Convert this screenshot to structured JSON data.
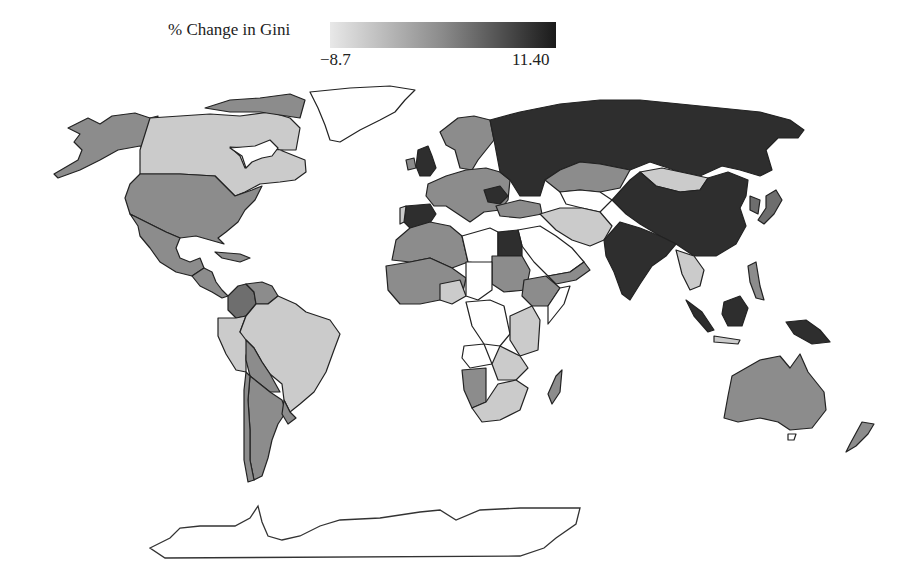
{
  "figure": {
    "type": "choropleth world map",
    "legend": {
      "title": "% Change in Gini",
      "min_label": "−8.7",
      "max_label": "11.40",
      "min_value": -8.7,
      "max_value": 11.4,
      "gradient_from": "#e6e6e6",
      "gradient_to": "#1c1c1c"
    },
    "shades": {
      "no_data": "#ffffff",
      "light": "#cbcbcb",
      "mid": "#8c8c8c",
      "dark_mid": "#6e6e6e",
      "dark": "#2e2e2e"
    },
    "regions": [
      {
        "name": "Alaska (USA)",
        "shade": "mid"
      },
      {
        "name": "Canada",
        "shade": "light"
      },
      {
        "name": "Greenland",
        "shade": "no_data"
      },
      {
        "name": "United States",
        "shade": "mid"
      },
      {
        "name": "Mexico",
        "shade": "mid"
      },
      {
        "name": "Central America",
        "shade": "mid"
      },
      {
        "name": "Colombia",
        "shade": "dark_mid"
      },
      {
        "name": "Venezuela",
        "shade": "mid"
      },
      {
        "name": "Brazil",
        "shade": "light"
      },
      {
        "name": "Peru",
        "shade": "light"
      },
      {
        "name": "Bolivia",
        "shade": "mid"
      },
      {
        "name": "Argentina",
        "shade": "mid"
      },
      {
        "name": "Chile",
        "shade": "mid"
      },
      {
        "name": "United Kingdom",
        "shade": "dark"
      },
      {
        "name": "Spain",
        "shade": "dark"
      },
      {
        "name": "Scandinavia",
        "shade": "mid"
      },
      {
        "name": "Western Europe",
        "shade": "mid"
      },
      {
        "name": "Russia",
        "shade": "dark"
      },
      {
        "name": "Kazakhstan",
        "shade": "mid"
      },
      {
        "name": "Mongolia",
        "shade": "light"
      },
      {
        "name": "China",
        "shade": "dark"
      },
      {
        "name": "India",
        "shade": "dark"
      },
      {
        "name": "Iran",
        "shade": "light"
      },
      {
        "name": "Saudi Arabia",
        "shade": "no_data"
      },
      {
        "name": "Egypt",
        "shade": "dark"
      },
      {
        "name": "Algeria",
        "shade": "mid"
      },
      {
        "name": "Libya",
        "shade": "no_data"
      },
      {
        "name": "Sudan",
        "shade": "mid"
      },
      {
        "name": "DR Congo",
        "shade": "no_data"
      },
      {
        "name": "Ethiopia",
        "shade": "mid"
      },
      {
        "name": "South Africa",
        "shade": "light"
      },
      {
        "name": "Namibia",
        "shade": "mid"
      },
      {
        "name": "Madagascar",
        "shade": "mid"
      },
      {
        "name": "Indonesia (Borneo)",
        "shade": "dark"
      },
      {
        "name": "Papua New Guinea",
        "shade": "dark"
      },
      {
        "name": "Japan",
        "shade": "dark_mid"
      },
      {
        "name": "Australia",
        "shade": "mid"
      },
      {
        "name": "New Zealand",
        "shade": "mid"
      },
      {
        "name": "Antarctica",
        "shade": "no_data"
      }
    ]
  }
}
